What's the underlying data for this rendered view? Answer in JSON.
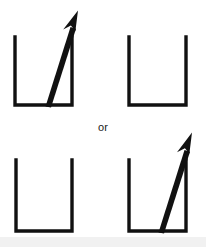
{
  "figure": {
    "connector_label": "or",
    "background_color": "#ffffff",
    "stroke_color": "#111111",
    "band_color": "#f1f1f1",
    "canvas": {
      "width": 206,
      "height": 247
    }
  },
  "options": [
    {
      "id": "option-a",
      "row": "top",
      "cups": [
        {
          "id": "top-left-cup",
          "position": "left",
          "has_arrow": true,
          "arrow_direction": "up-right",
          "geometry": {
            "left": 15,
            "right": 72,
            "top": 37,
            "bottom": 106
          },
          "arrow": {
            "tail_x": 47,
            "tail_y": 106,
            "tip_x": 76,
            "tip_y": 11
          }
        },
        {
          "id": "top-right-cup",
          "position": "right",
          "has_arrow": false,
          "arrow_direction": null,
          "geometry": {
            "left": 129,
            "right": 186,
            "top": 37,
            "bottom": 106
          },
          "arrow": null
        }
      ]
    },
    {
      "id": "option-b",
      "row": "bottom",
      "cups": [
        {
          "id": "bottom-left-cup",
          "position": "left",
          "has_arrow": false,
          "arrow_direction": null,
          "geometry": {
            "left": 16,
            "right": 72,
            "top": 160,
            "bottom": 232
          },
          "arrow": null
        },
        {
          "id": "bottom-right-cup",
          "position": "right",
          "has_arrow": true,
          "arrow_direction": "up-right",
          "geometry": {
            "left": 129,
            "right": 186,
            "top": 160,
            "bottom": 232
          },
          "arrow": {
            "tail_x": 160,
            "tail_y": 232,
            "tip_x": 190,
            "tip_y": 133
          }
        }
      ]
    }
  ]
}
